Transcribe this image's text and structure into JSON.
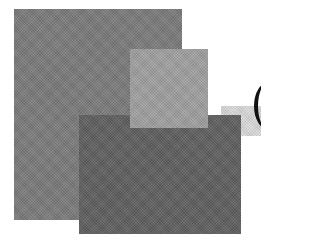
{
  "graphic": {
    "description": "Abstract logo of overlapping gray rectangles",
    "shapes": [
      {
        "name": "large-rectangle",
        "color": "#7b7b7b"
      },
      {
        "name": "light-square",
        "color": "#a0a0a0"
      },
      {
        "name": "dark-rectangle",
        "color": "#5f5f5f"
      },
      {
        "name": "faint-band",
        "color": "#dadada"
      },
      {
        "name": "partial-arc",
        "color": "#111111"
      }
    ]
  }
}
